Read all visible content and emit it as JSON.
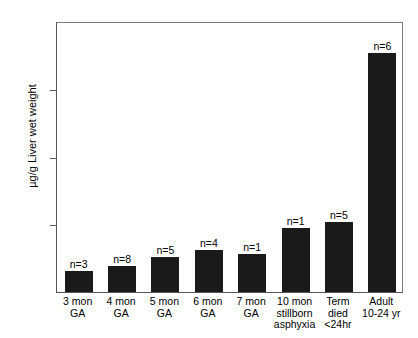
{
  "chart_data": {
    "type": "bar",
    "title": "",
    "xlabel": "",
    "ylabel": "µg/g Liver wet weight",
    "ylim": [
      0,
      24
    ],
    "yticks": [
      0,
      6,
      12,
      18,
      24
    ],
    "ytick_labels": [
      "0",
      "6",
      "12",
      "18",
      "24"
    ],
    "grid": false,
    "legend": "none",
    "bar_color": "#1a1a1a",
    "categories": [
      "3 mon GA",
      "4 mon GA",
      "5 mon GA",
      "6 mon GA",
      "7 mon GA",
      "10 mon stillborn asphyxia",
      "Term died <24hr",
      "Adult 10-24 yr"
    ],
    "category_label_lines": [
      [
        "3 mon",
        "GA"
      ],
      [
        "4 mon",
        "GA"
      ],
      [
        "5 mon",
        "GA"
      ],
      [
        "6 mon",
        "GA"
      ],
      [
        "7 mon",
        "GA"
      ],
      [
        "10 mon",
        "stillborn",
        "asphyxia"
      ],
      [
        "Term",
        "died",
        "<24hr"
      ],
      [
        "Adult",
        "10-24 yr"
      ]
    ],
    "values": [
      1.9,
      2.3,
      3.1,
      3.7,
      3.4,
      5.7,
      6.2,
      21.2
    ],
    "annotations": [
      "n=3",
      "n=8",
      "n=5",
      "n=4",
      "n=1",
      "n=1",
      "n=5",
      "n=6"
    ],
    "sample_sizes": [
      3,
      8,
      5,
      4,
      1,
      1,
      5,
      6
    ]
  }
}
